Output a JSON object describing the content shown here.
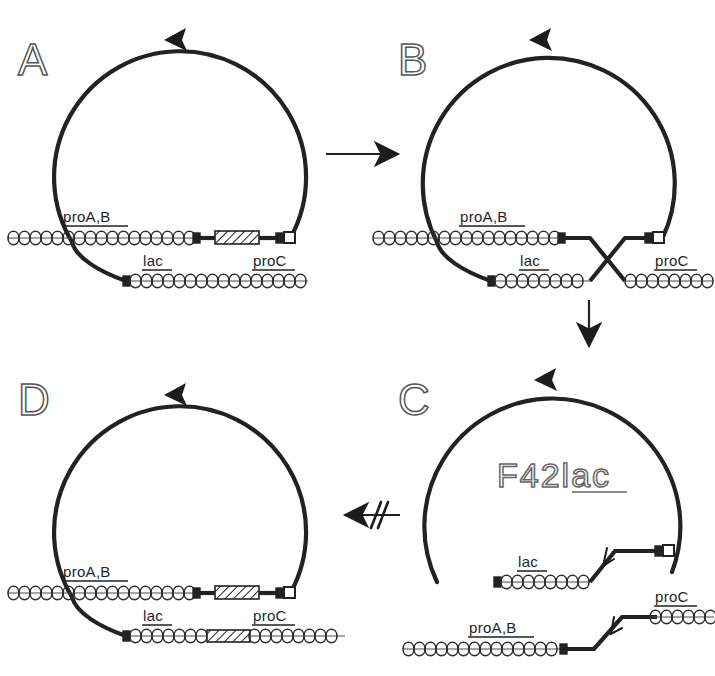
{
  "figure": {
    "background_color": "#ffffff",
    "ink_color": "#1c1c1c",
    "width": 715,
    "height": 676
  },
  "panels": [
    {
      "id": "A",
      "letter": "A",
      "caption": "",
      "gene_labels": [
        "proA,B",
        "lac",
        "proC"
      ],
      "episome_label": "",
      "has_crossover": false,
      "has_hatched_insert_bottom": false
    },
    {
      "id": "B",
      "letter": "B",
      "caption": "",
      "gene_labels": [
        "proA,B",
        "lac",
        "proC"
      ],
      "episome_label": "",
      "has_crossover": true,
      "has_hatched_insert_bottom": false
    },
    {
      "id": "C",
      "letter": "C",
      "caption": "",
      "gene_labels": [
        "lac",
        "proA,B",
        "proC"
      ],
      "episome_label": "F42lac",
      "episome_label_prefix": "F42",
      "episome_label_gene": "lac",
      "has_crossover": false,
      "has_hatched_insert_bottom": false
    },
    {
      "id": "D",
      "letter": "D",
      "caption": "",
      "gene_labels": [
        "proA,B",
        "lac",
        "proC"
      ],
      "episome_label": "",
      "has_crossover": false,
      "has_hatched_insert_bottom": true
    }
  ],
  "flow_arrows": [
    {
      "id": "a-to-b",
      "from": "A",
      "to": "B",
      "direction": "right",
      "blocked": false
    },
    {
      "id": "b-to-c",
      "from": "B",
      "to": "C",
      "direction": "down",
      "blocked": false
    },
    {
      "id": "c-to-d",
      "from": "C",
      "to": "D",
      "direction": "left",
      "blocked": true,
      "blocked_marker": "//"
    }
  ],
  "legend_keys": {
    "helix": "coiled chromosome strand",
    "hatched_box": "hatched insertion segment",
    "open_square": "episome junction terminus",
    "triangle": "replication direction arrowhead"
  }
}
